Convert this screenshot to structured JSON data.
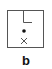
{
  "figure": {
    "panel_label": "b",
    "elements": [
      {
        "type": "frame",
        "shape": "square"
      },
      {
        "type": "corner-mark",
        "shape": "L",
        "position": "top-center"
      },
      {
        "type": "dot",
        "position": "center"
      },
      {
        "type": "cross",
        "position": "below-center"
      }
    ],
    "colors": {
      "stroke": "#555555",
      "dot": "#111111"
    }
  }
}
